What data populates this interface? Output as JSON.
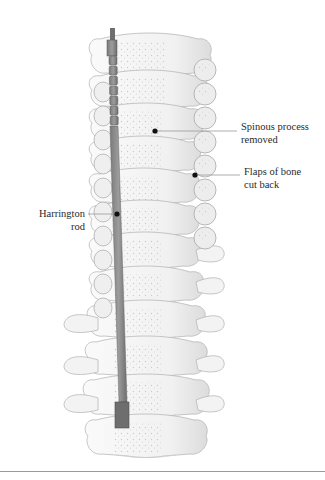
{
  "figure": {
    "top_caption": "",
    "colors": {
      "bone_fill": "#f4f4f4",
      "bone_stroke": "#b8b8b8",
      "bone_speckle": "#c8c8c8",
      "rod": "#8c8c8c",
      "rod_dark": "#6e6e6e",
      "leader_line": "#9a9a9a",
      "leader_dot": "#111111",
      "label_text": "#2a2a2a",
      "rule": "#9a9a9a"
    },
    "labels": [
      {
        "id": "spinous",
        "lines": [
          "Spinous process",
          "removed"
        ]
      },
      {
        "id": "flaps",
        "lines": [
          "Flaps of bone",
          "cut back"
        ]
      },
      {
        "id": "rod",
        "lines": [
          "Harrington",
          "rod"
        ]
      }
    ]
  }
}
